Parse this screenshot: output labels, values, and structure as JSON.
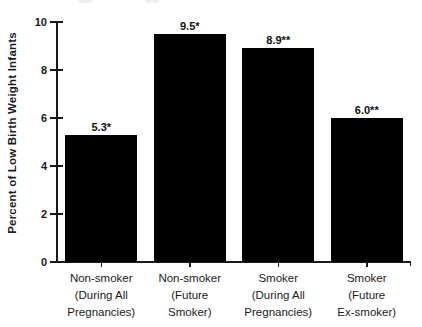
{
  "chart_data": {
    "type": "bar",
    "title": "",
    "xlabel": "",
    "ylabel": "Percent of Low Birth Weight Infants",
    "ylim": [
      0,
      10
    ],
    "yticks": [
      0,
      2,
      4,
      6,
      8,
      10
    ],
    "ytick_labels": [
      "0",
      "2",
      "4",
      "6",
      "8",
      "10"
    ],
    "categories": [
      [
        "Non-smoker",
        "(During All",
        "Pregnancies)"
      ],
      [
        "Non-smoker",
        "(Future",
        "Smoker)"
      ],
      [
        "Smoker",
        "(During All",
        "Pregnancies)"
      ],
      [
        "Smoker",
        "(Future",
        "Ex-smoker)"
      ]
    ],
    "values": [
      5.3,
      9.5,
      8.9,
      6.0
    ],
    "value_labels": [
      "5.3*",
      "9.5*",
      "8.9**",
      "6.0**"
    ],
    "bar_color": "#000000",
    "axis_color": "#1a1a1a",
    "grid": false,
    "legend_position": "none"
  }
}
